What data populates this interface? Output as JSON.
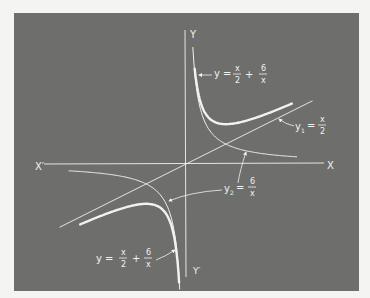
{
  "colors": {
    "page_background": "#f4f4f2",
    "panel_background": "#6e6e6c",
    "line": "#f2f2f0"
  },
  "axes": {
    "x_pos_label": "X",
    "x_neg_label": "X′",
    "y_pos_label": "Y",
    "y_neg_label": "Y′"
  },
  "labels": {
    "sum_top": {
      "lhs": "y =",
      "frac1_num": "x",
      "frac1_den": "2",
      "plus": "+",
      "frac2_num": "6",
      "frac2_den": "x"
    },
    "sum_bottom": {
      "lhs": "y =",
      "frac1_num": "x",
      "frac1_den": "2",
      "plus": "+",
      "frac2_num": "6",
      "frac2_den": "x"
    },
    "y1": {
      "lhs": "y",
      "sub": "1",
      "eq": "=",
      "num": "x",
      "den": "2"
    },
    "y2": {
      "lhs": "y",
      "sub": "2",
      "eq": "=",
      "num": "6",
      "den": "x"
    }
  },
  "chart_data": {
    "type": "line",
    "title": "",
    "xlabel": "X",
    "ylabel": "Y",
    "grid": false,
    "origin_px": [
      186,
      164
    ],
    "px_per_unit": 11.5,
    "xlim": [
      -14,
      14
    ],
    "ylim": [
      -11,
      11.5
    ],
    "series": [
      {
        "name": "y1 = x/2",
        "style": "thin",
        "x": [
          -11,
          11
        ],
        "y": [
          -5.5,
          5.5
        ]
      },
      {
        "name": "y2 = 6/x (x>0)",
        "style": "thin",
        "x_range": [
          0.59,
          9.65
        ]
      },
      {
        "name": "y2 = 6/x (x<0)",
        "style": "thin",
        "x_range": [
          -10.2,
          -0.55
        ]
      },
      {
        "name": "y = x/2 + 6/x (x>0)",
        "style": "bold",
        "x_range": [
          0.75,
          9.2
        ],
        "minimum": [
          3.46,
          3.46
        ]
      },
      {
        "name": "y = x/2 + 6/x (x<0)",
        "style": "bold",
        "x_range": [
          -9.2,
          -0.6
        ],
        "maximum": [
          -3.46,
          -3.46
        ]
      }
    ],
    "annotations": [
      "y = x/2 + 6/x",
      "y1 = x/2",
      "y2 = 6/x",
      "y = x/2 + 6/x"
    ]
  }
}
